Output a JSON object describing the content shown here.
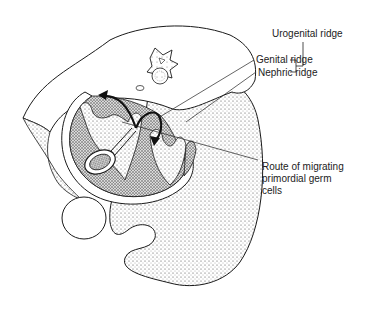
{
  "figure": {
    "labels": {
      "urogenital_ridge": "Urogenital ridge",
      "genital_ridge": "Genital ridge",
      "nephric_ridge": "Nephric ridge",
      "route_line1": "Route of migrating",
      "route_line2": "primordial germ",
      "route_line3": "cells"
    }
  },
  "colors": {
    "ink": "#1a1a1a",
    "stipple": "#555555",
    "background": "#ffffff"
  }
}
